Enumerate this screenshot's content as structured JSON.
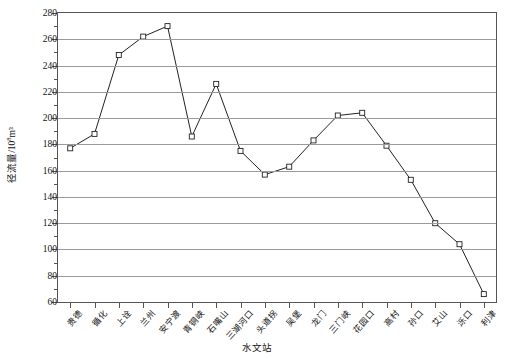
{
  "chart_data": {
    "type": "line",
    "title": "",
    "xlabel": "水文站",
    "ylabel": "径流量/10⁸m³",
    "ylabel_base": "径流量/10",
    "ylabel_exp": "8",
    "ylabel_tail": "m³",
    "ylim": [
      60,
      280
    ],
    "ytick_step": 20,
    "yticks": [
      60,
      80,
      100,
      120,
      140,
      160,
      180,
      200,
      220,
      240,
      260,
      280
    ],
    "ytick_labels": [
      "60",
      "80",
      "100",
      "120",
      "140",
      "160",
      "180",
      "200",
      "220",
      "240",
      "260",
      "280"
    ],
    "grid": true,
    "legend": "none",
    "marker": "open-square",
    "line_color": "#222222",
    "grid_color": "#9a9a9a",
    "axis_color": "#555555",
    "categories": [
      "贵德",
      "循化",
      "上诠",
      "兰州",
      "安宁渡",
      "青铜峡",
      "石嘴山",
      "三湖河口",
      "头道拐",
      "吴堡",
      "龙门",
      "三门峡",
      "花园口",
      "高村",
      "孙口",
      "艾山",
      "泺口",
      "利津"
    ],
    "values": [
      177,
      188,
      248,
      262,
      270,
      186,
      226,
      175,
      157,
      163,
      183,
      202,
      204,
      179,
      153,
      120,
      104,
      66
    ],
    "series": [
      {
        "name": "径流量",
        "values": [
          177,
          188,
          248,
          262,
          270,
          186,
          226,
          175,
          157,
          163,
          183,
          202,
          204,
          179,
          153,
          120,
          104,
          66
        ]
      }
    ]
  }
}
